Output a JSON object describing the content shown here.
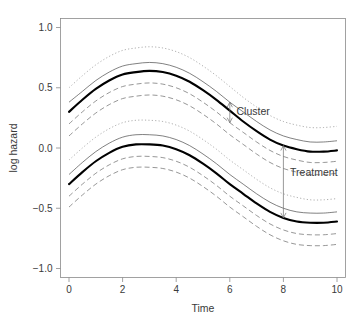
{
  "chart_data": {
    "type": "line",
    "title": "",
    "xlabel": "Time",
    "ylabel": "log hazard",
    "xlim": [
      0,
      10
    ],
    "ylim": [
      -1.0,
      1.0
    ],
    "xticks": [
      "0",
      "2",
      "4",
      "6",
      "8",
      "10"
    ],
    "xtick_values": [
      0,
      2,
      4,
      6,
      8,
      10
    ],
    "yticks": [
      "1.0",
      "0.5",
      "0.0",
      "-0.5",
      "-1.0"
    ],
    "ytick_values": [
      1.0,
      0.5,
      0.0,
      -0.5,
      -1.0
    ],
    "grid": false,
    "legend": null,
    "x": [
      0,
      0.5,
      1,
      1.5,
      2,
      2.5,
      3,
      3.5,
      4,
      4.5,
      5,
      5.5,
      6,
      6.5,
      7,
      7.5,
      8,
      8.5,
      9,
      9.5,
      10
    ],
    "series": [
      {
        "name": "upper-group-center",
        "style": "thick-solid",
        "values": [
          0.3,
          0.4,
          0.49,
          0.56,
          0.61,
          0.63,
          0.64,
          0.63,
          0.6,
          0.55,
          0.48,
          0.4,
          0.31,
          0.22,
          0.14,
          0.07,
          0.02,
          -0.01,
          -0.03,
          -0.03,
          -0.02
        ]
      },
      {
        "name": "upper-group-inner-upper",
        "style": "thin-solid",
        "values": [
          0.38,
          0.47,
          0.56,
          0.63,
          0.68,
          0.7,
          0.71,
          0.7,
          0.67,
          0.62,
          0.55,
          0.47,
          0.38,
          0.3,
          0.22,
          0.15,
          0.1,
          0.07,
          0.05,
          0.05,
          0.06
        ]
      },
      {
        "name": "upper-group-inner-lower",
        "style": "dashed",
        "values": [
          0.2,
          0.3,
          0.39,
          0.46,
          0.51,
          0.53,
          0.54,
          0.53,
          0.5,
          0.45,
          0.38,
          0.3,
          0.21,
          0.13,
          0.05,
          -0.02,
          -0.07,
          -0.1,
          -0.12,
          -0.12,
          -0.11
        ]
      },
      {
        "name": "upper-group-outer-upper",
        "style": "dotted",
        "values": [
          0.5,
          0.6,
          0.69,
          0.76,
          0.81,
          0.83,
          0.84,
          0.83,
          0.8,
          0.75,
          0.68,
          0.6,
          0.51,
          0.42,
          0.34,
          0.27,
          0.22,
          0.19,
          0.17,
          0.17,
          0.18
        ]
      },
      {
        "name": "upper-group-outer-lower",
        "style": "dashed",
        "values": [
          0.1,
          0.2,
          0.29,
          0.36,
          0.41,
          0.43,
          0.44,
          0.43,
          0.4,
          0.35,
          0.28,
          0.2,
          0.11,
          0.03,
          -0.05,
          -0.12,
          -0.17,
          -0.2,
          -0.22,
          -0.22,
          -0.21
        ]
      },
      {
        "name": "lower-group-center",
        "style": "thick-solid",
        "values": [
          -0.3,
          -0.2,
          -0.11,
          -0.04,
          0.01,
          0.03,
          0.03,
          0.02,
          -0.01,
          -0.06,
          -0.13,
          -0.21,
          -0.3,
          -0.38,
          -0.46,
          -0.53,
          -0.58,
          -0.61,
          -0.62,
          -0.62,
          -0.61
        ]
      },
      {
        "name": "lower-group-inner-upper",
        "style": "thin-solid",
        "values": [
          -0.22,
          -0.12,
          -0.03,
          0.04,
          0.09,
          0.11,
          0.11,
          0.1,
          0.07,
          0.02,
          -0.05,
          -0.13,
          -0.22,
          -0.3,
          -0.38,
          -0.45,
          -0.5,
          -0.53,
          -0.54,
          -0.54,
          -0.53
        ]
      },
      {
        "name": "lower-group-inner-lower",
        "style": "dashed",
        "values": [
          -0.4,
          -0.3,
          -0.21,
          -0.14,
          -0.09,
          -0.07,
          -0.07,
          -0.08,
          -0.11,
          -0.16,
          -0.23,
          -0.31,
          -0.4,
          -0.48,
          -0.56,
          -0.63,
          -0.68,
          -0.71,
          -0.72,
          -0.72,
          -0.71
        ]
      },
      {
        "name": "lower-group-outer-upper",
        "style": "dotted",
        "values": [
          -0.1,
          0.0,
          0.09,
          0.16,
          0.21,
          0.23,
          0.23,
          0.22,
          0.19,
          0.14,
          0.07,
          -0.01,
          -0.1,
          -0.18,
          -0.26,
          -0.33,
          -0.38,
          -0.41,
          -0.43,
          -0.43,
          -0.42
        ]
      },
      {
        "name": "lower-group-outer-lower",
        "style": "dashed",
        "values": [
          -0.49,
          -0.39,
          -0.3,
          -0.23,
          -0.18,
          -0.16,
          -0.16,
          -0.17,
          -0.2,
          -0.25,
          -0.32,
          -0.4,
          -0.49,
          -0.57,
          -0.65,
          -0.72,
          -0.77,
          -0.8,
          -0.81,
          -0.81,
          -0.8
        ]
      }
    ],
    "annotations": [
      {
        "name": "cluster",
        "label": "Cluster",
        "x": 6.0,
        "y_top": 0.38,
        "y_bottom": 0.21,
        "label_x": 6.25,
        "label_y": 0.3,
        "arrow": "double-headed-vertical"
      },
      {
        "name": "treatment",
        "label": "Treatment",
        "x": 8.0,
        "y_top": 0.02,
        "y_bottom": -0.58,
        "label_x": 8.25,
        "label_y": -0.2,
        "arrow": "double-headed-vertical"
      }
    ]
  },
  "colors": {
    "background": "#ffffff",
    "axis": "#8a8a8a",
    "text": "#3a3a3a",
    "curve_thick": "#000000",
    "curve_thin": "#4a4a4a",
    "curve_dashed": "#6a6a6a",
    "curve_dotted": "#8c8c8c",
    "annotation": "#6e6e6e"
  }
}
